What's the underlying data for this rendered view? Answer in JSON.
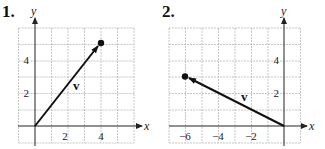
{
  "problems": [
    {
      "number": "1.",
      "x_label": "x",
      "y_label": "y",
      "x_ticks": [
        "2",
        "4"
      ],
      "y_ticks": [
        "2",
        "4"
      ],
      "vector_label": "v",
      "vector": {
        "from": [
          0,
          0
        ],
        "to": [
          4,
          5
        ]
      }
    },
    {
      "number": "2.",
      "x_label": "x",
      "y_label": "y",
      "x_ticks": [
        "−6",
        "−4",
        "−2"
      ],
      "y_ticks": [
        "2",
        "4"
      ],
      "vector_label": "v",
      "vector": {
        "from": [
          0,
          0
        ],
        "to": [
          -6,
          3
        ]
      }
    }
  ]
}
